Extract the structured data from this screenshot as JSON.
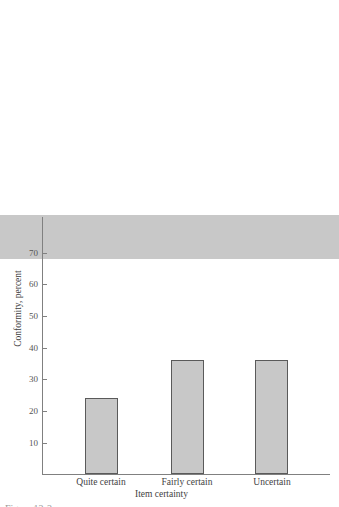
{
  "chart_data": {
    "type": "bar",
    "title": "",
    "subtitle": "",
    "categories": [
      "Quite certain",
      "Fairly certain",
      "Uncertain"
    ],
    "values": [
      14,
      24,
      36
    ],
    "series": [
      {
        "name": "Conformity",
        "values": [
          14,
          24,
          36
        ]
      }
    ],
    "xlabel": "Item certainty",
    "ylabel": "Conformity, percent",
    "ylim": [
      0,
      78
    ],
    "yticks": [
      10,
      20,
      30,
      40,
      50,
      60,
      70
    ],
    "ytick_labels": [
      "10",
      "20",
      "30",
      "40",
      "50",
      "60",
      "70"
    ],
    "xlim_categories": 3,
    "grid": false,
    "legend": false,
    "legend_position": "none",
    "bar_fill_color": "#c8c8c8",
    "bar_edge_color": "#5a5a5a",
    "axis_color": "#808080",
    "text_color": "#3f3f3f",
    "background_color": "#ffffff",
    "annotations": []
  },
  "axes": {
    "y_title": "Conformity, percent",
    "x_title": "Item certainty",
    "ticks": [
      {
        "value": 70,
        "label": "70"
      },
      {
        "value": 60,
        "label": "60"
      },
      {
        "value": 50,
        "label": "50"
      },
      {
        "value": 40,
        "label": "40"
      },
      {
        "value": 30,
        "label": "30"
      },
      {
        "value": 20,
        "label": "20"
      },
      {
        "value": 10,
        "label": "10"
      }
    ]
  },
  "bars": [
    {
      "label": "Quite certain",
      "value": 14,
      "value_label": "14"
    },
    {
      "label": "Fairly certain",
      "value": 24,
      "value_label": "24"
    },
    {
      "label": "Uncertain",
      "value": 36,
      "value_label": "36"
    }
  ],
  "caption": {
    "text": "Figure 12-2"
  }
}
